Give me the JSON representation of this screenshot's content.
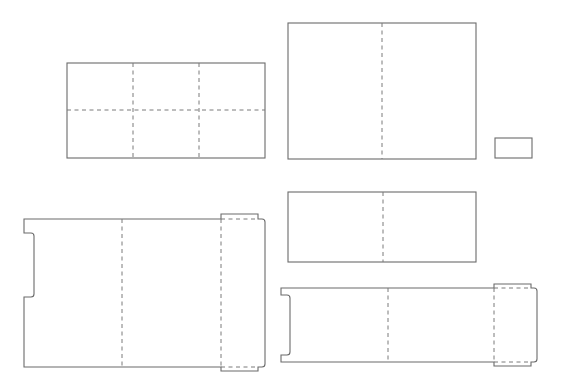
{
  "canvas": {
    "width": 567,
    "height": 384,
    "background": "#ffffff"
  },
  "colors": {
    "cut_line": "#6b6b6b",
    "fold_line": "#7a7a7a"
  },
  "legend_semantics": {
    "solid": "cut line",
    "dashed": "fold line"
  },
  "shapes": [
    {
      "id": "panel-grid-2x3",
      "kind": "rect",
      "x": 67,
      "y": 63,
      "w": 198,
      "h": 95,
      "folds": [
        {
          "x1": 133,
          "y1": 63,
          "x2": 133,
          "y2": 158
        },
        {
          "x1": 199,
          "y1": 63,
          "x2": 199,
          "y2": 158
        },
        {
          "x1": 67,
          "y1": 110,
          "x2": 265,
          "y2": 110
        }
      ]
    },
    {
      "id": "panel-bifold-tall",
      "kind": "rect",
      "x": 288,
      "y": 23,
      "w": 188,
      "h": 136,
      "folds": [
        {
          "x1": 382,
          "y1": 23,
          "x2": 382,
          "y2": 159
        }
      ]
    },
    {
      "id": "panel-small",
      "kind": "rect",
      "x": 495,
      "y": 138,
      "w": 37,
      "h": 20,
      "folds": []
    },
    {
      "id": "panel-bifold-short",
      "kind": "rect",
      "x": 288,
      "y": 192,
      "w": 188,
      "h": 70,
      "folds": [
        {
          "x1": 383,
          "y1": 192,
          "x2": 383,
          "y2": 262
        }
      ]
    },
    {
      "id": "box-dieline-large",
      "kind": "path",
      "d": "M24 219 L221 219 L221 214 L258 214 L258 219 L262 219 Q265 219 265 222 L265 364 Q265 367 262 367 L258 367 L258 371 L221 371 L221 367 L24 367 L24 297 L31 297 Q34 297 34 294 L34 236 Q34 233 31 233 L24 233 Z",
      "folds": [
        {
          "x1": 122,
          "y1": 219,
          "x2": 122,
          "y2": 367
        },
        {
          "x1": 221,
          "y1": 219,
          "x2": 221,
          "y2": 367
        },
        {
          "x1": 221,
          "y1": 219,
          "x2": 258,
          "y2": 219
        },
        {
          "x1": 221,
          "y1": 367,
          "x2": 258,
          "y2": 367
        }
      ]
    },
    {
      "id": "box-dieline-long",
      "kind": "path",
      "d": "M281 288 L494 288 L494 284 L531 284 L531 288 L534 288 Q537 288 537 291 L537 359 Q537 362 534 362 L531 362 L531 366 L494 366 L494 362 L281 362 L281 355 L287 355 Q290 355 290 352 L290 298 Q290 295 287 295 L281 295 Z",
      "folds": [
        {
          "x1": 388,
          "y1": 288,
          "x2": 388,
          "y2": 362
        },
        {
          "x1": 494,
          "y1": 288,
          "x2": 494,
          "y2": 362
        },
        {
          "x1": 494,
          "y1": 288,
          "x2": 531,
          "y2": 288
        },
        {
          "x1": 494,
          "y1": 362,
          "x2": 531,
          "y2": 362
        }
      ]
    }
  ]
}
